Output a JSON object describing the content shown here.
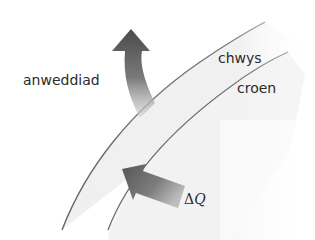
{
  "diagram": {
    "type": "skin-sweat heat flow diagram",
    "labels": {
      "evaporation": "anweddiad",
      "sweat": "chwys",
      "skin": "croen",
      "heat_delta": "Δ",
      "heat_symbol": "Q"
    },
    "colors": {
      "background": "#ffffff",
      "band_fill": "#ececec",
      "curve_line": "#6a6a6a",
      "arrow_dark": "#4a4a4a",
      "arrow_light": "#c8c8c8",
      "text": "#2b2b2b"
    },
    "elements": {
      "outer_curve": "sweat layer surface",
      "inner_curve": "skin surface",
      "upward_arrow": "evaporation arrow leaving sweat layer",
      "inward_arrow": "heat flow ΔQ arrow into skin"
    }
  }
}
